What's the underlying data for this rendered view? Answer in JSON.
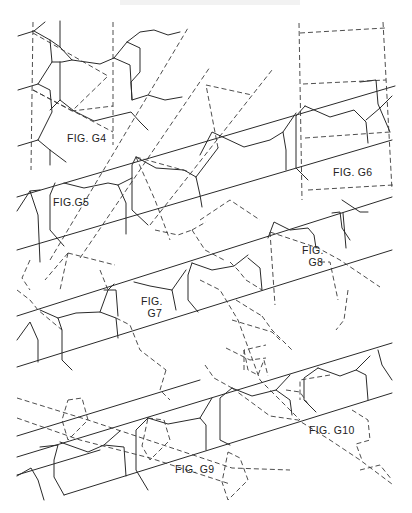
{
  "document": {
    "type": "patent drawing sheet",
    "header_text_visible": false
  },
  "figures": [
    {
      "id": "G4",
      "label": "FIG. G4",
      "pos": [
        67,
        138
      ]
    },
    {
      "id": "G5",
      "label": "FIG.G5",
      "pos": [
        53,
        198
      ]
    },
    {
      "id": "G6",
      "label": "FIG. G6",
      "pos": [
        333,
        167
      ]
    },
    {
      "id": "G7",
      "label": "FIG.\n  G7",
      "pos": [
        141,
        296
      ]
    },
    {
      "id": "G8",
      "label": "FIG.\n  G8",
      "pos": [
        302,
        244
      ]
    },
    {
      "id": "G9",
      "label": "FIG. G9",
      "pos": [
        175,
        464
      ]
    },
    {
      "id": "G10",
      "label": "FIG. G10",
      "pos": [
        309,
        426
      ]
    }
  ],
  "colors": {
    "ink": "#2a2a2a",
    "paper": "#ffffff"
  }
}
